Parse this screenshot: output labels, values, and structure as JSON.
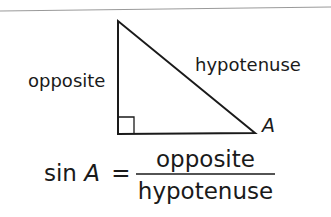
{
  "diagram": {
    "type": "right-triangle",
    "vertices": {
      "top": [
        118,
        21
      ],
      "right_angle": [
        118,
        134
      ],
      "A": [
        255,
        133
      ]
    },
    "labels": {
      "vertical_side": "opposite",
      "slanted_side": "hypotenuse",
      "angle_vertex": "A"
    },
    "right_angle_marker": true
  },
  "formula": {
    "lhs_fn": "sin",
    "lhs_var": "A",
    "equals": "=",
    "numerator": "opposite",
    "denominator": "hypotenuse"
  },
  "colors": {
    "stroke": "#1a1a1a",
    "top_rule": "#9a9a9a",
    "background": "#ffffff"
  }
}
